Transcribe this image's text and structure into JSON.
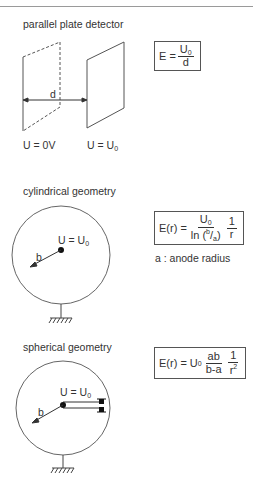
{
  "header": {
    "clipped_title": "... energy ... ... ...p..."
  },
  "sections": {
    "parallel": {
      "title": "parallel plate detector",
      "distance_label": "d",
      "left_plate_label": "U = 0V",
      "right_plate_label_main": "U = U",
      "right_plate_label_sub": "0",
      "formula": {
        "lhs": "E =",
        "num_main": "U",
        "num_sub": "0",
        "den": "d"
      }
    },
    "cylindrical": {
      "title": "cylindrical geometry",
      "potential_main": "U = U",
      "potential_sub": "0",
      "radius_label": "b",
      "formula": {
        "lhs": "E(r) =",
        "num_main": "U",
        "num_sub": "0",
        "den": "ln (b/a)",
        "den_ln": "ln (",
        "den_b": "b",
        "den_slash": "/",
        "den_a": "a",
        "den_close": ")",
        "num2": "1",
        "den2": "r"
      },
      "note": "a :  anode radius"
    },
    "spherical": {
      "title": "spherical geometry",
      "potential_main": "U = U",
      "potential_sub": "0",
      "radius_label": "b",
      "formula": {
        "lhs": "E(r) = U",
        "lhs_sub": "0",
        "num": "ab",
        "den": "b-a",
        "num2": "1",
        "den2_main": "r",
        "den2_sup": "2"
      }
    }
  },
  "colors": {
    "line": "#555555",
    "text": "#333333",
    "rule": "#9a9a9a"
  }
}
